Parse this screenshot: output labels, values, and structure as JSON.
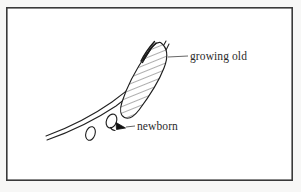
{
  "figure": {
    "kind": "hand-drawn-line-diagram",
    "background_color": "#fdfdfc",
    "paper_color": "#f7f7f6",
    "ink_color": "#1d1d1d",
    "frame": {
      "name": "plate-border",
      "x": 6,
      "y": 7,
      "width": 287,
      "height": 174,
      "stroke_color": "#3a3a3a",
      "stroke_width": 1.6
    },
    "labels": [
      {
        "id": "growing-old",
        "text": "growing old",
        "x": 190,
        "y": 51,
        "leader_from_x": 168,
        "leader_from_y": 57,
        "leader_to_x": 187,
        "leader_to_y": 56
      },
      {
        "id": "newborn",
        "text": "newborn",
        "x": 137,
        "y": 121,
        "leader_from_x": 133,
        "leader_from_y": 126,
        "leader_to_x": 119,
        "leader_to_y": 124
      }
    ],
    "shapes": [
      {
        "id": "hatched-blob",
        "semantic": "growing-old-region",
        "description": "elongated hatched ellipse tilted upper-right",
        "hatch_color": "#3c3c3c",
        "outline_color": "#1d1d1d"
      },
      {
        "id": "swept-curve",
        "semantic": "double-curve-track",
        "description": "two near-parallel curved lines sweeping lower-left to upper-right"
      },
      {
        "id": "oval-small-left",
        "semantic": "small-oval",
        "description": "tiny outlined oval lower left"
      },
      {
        "id": "oval-newborn",
        "semantic": "newborn-oval",
        "description": "small outlined oval marked by arrowhead"
      },
      {
        "id": "arrowhead",
        "semantic": "newborn-pointer",
        "description": "solid black triangular arrowhead pointing up-left at newborn oval"
      }
    ]
  }
}
